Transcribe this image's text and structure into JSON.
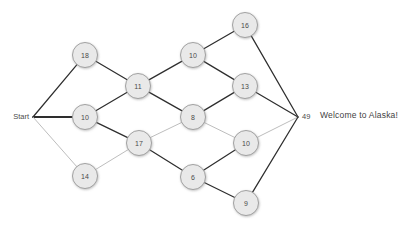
{
  "graph": {
    "start": {
      "label": "Start",
      "x": 33,
      "y": 117
    },
    "end": {
      "label": "49",
      "x": 298,
      "y": 117
    },
    "node_radius": 12.5,
    "nodes": [
      {
        "id": "n18",
        "label": "18",
        "x": 85,
        "y": 55
      },
      {
        "id": "n11",
        "label": "11",
        "x": 138,
        "y": 86
      },
      {
        "id": "n10a",
        "label": "10",
        "x": 85,
        "y": 117
      },
      {
        "id": "n14",
        "label": "14",
        "x": 85,
        "y": 176
      },
      {
        "id": "n10b",
        "label": "10",
        "x": 193,
        "y": 55
      },
      {
        "id": "n16",
        "label": "16",
        "x": 245,
        "y": 25
      },
      {
        "id": "n13",
        "label": "13",
        "x": 245,
        "y": 86
      },
      {
        "id": "n8",
        "label": "8",
        "x": 193,
        "y": 117
      },
      {
        "id": "n17",
        "label": "17",
        "x": 139,
        "y": 143
      },
      {
        "id": "n10c",
        "label": "10",
        "x": 246,
        "y": 143
      },
      {
        "id": "n6",
        "label": "6",
        "x": 193,
        "y": 177
      },
      {
        "id": "n9",
        "label": "9",
        "x": 246,
        "y": 203
      }
    ],
    "edges": [
      {
        "from": "start",
        "to": "n18",
        "weight": "dark"
      },
      {
        "from": "start",
        "to": "n10a",
        "weight": "bold"
      },
      {
        "from": "start",
        "to": "n14",
        "weight": "light"
      },
      {
        "from": "n18",
        "to": "n11",
        "weight": "dark"
      },
      {
        "from": "n10a",
        "to": "n11",
        "weight": "dark"
      },
      {
        "from": "n10a",
        "to": "n17",
        "weight": "dark"
      },
      {
        "from": "n14",
        "to": "n17",
        "weight": "light"
      },
      {
        "from": "n11",
        "to": "n10b",
        "weight": "dark"
      },
      {
        "from": "n11",
        "to": "n8",
        "weight": "dark"
      },
      {
        "from": "n17",
        "to": "n8",
        "weight": "light"
      },
      {
        "from": "n17",
        "to": "n6",
        "weight": "dark"
      },
      {
        "from": "n10b",
        "to": "n16",
        "weight": "dark"
      },
      {
        "from": "n10b",
        "to": "n13",
        "weight": "dark"
      },
      {
        "from": "n8",
        "to": "n13",
        "weight": "dark"
      },
      {
        "from": "n8",
        "to": "n10c",
        "weight": "light"
      },
      {
        "from": "n6",
        "to": "n10c",
        "weight": "dark"
      },
      {
        "from": "n6",
        "to": "n9",
        "weight": "dark"
      },
      {
        "from": "n16",
        "to": "end",
        "weight": "dark"
      },
      {
        "from": "n13",
        "to": "end",
        "weight": "dark"
      },
      {
        "from": "n10c",
        "to": "end",
        "weight": "light"
      },
      {
        "from": "n9",
        "to": "end",
        "weight": "dark"
      }
    ]
  },
  "message": {
    "text": "Welcome to Alaska!"
  },
  "colors": {
    "node_fill": "#e9e9e9",
    "node_stroke": "#9a9a9a",
    "edge_dark": "#2e2e2e",
    "edge_light": "#b5b5b5",
    "text": "#4a4a4a",
    "background": "#ffffff"
  }
}
